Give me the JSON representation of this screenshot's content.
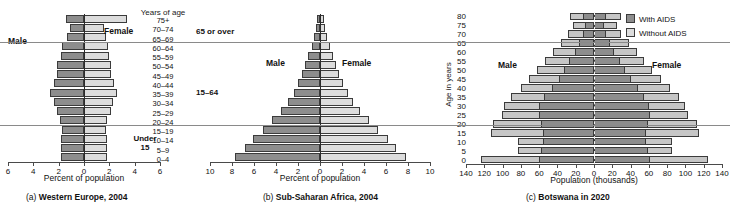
{
  "figure": {
    "panels": [
      "a",
      "b",
      "c"
    ]
  },
  "chart_data": [
    {
      "id": "a",
      "type": "bar",
      "orientation": "population-pyramid",
      "title": "(a) Western Europe, 2004",
      "caption_prefix": "(a)",
      "caption_text": "Western Europe, 2004",
      "xlabel": "Percent of population",
      "ylabel": "Years of age",
      "xlim": [
        -6,
        6
      ],
      "xticks": [
        "6",
        "4",
        "2",
        "0",
        "2",
        "4",
        "6"
      ],
      "xtick_values": [
        -6,
        -4,
        -2,
        0,
        2,
        4,
        6
      ],
      "grid": false,
      "legend_position": "none",
      "categories": [
        "75+",
        "70–74",
        "65–69",
        "60–64",
        "55–59",
        "50–54",
        "45–49",
        "40–44",
        "35–39",
        "30–34",
        "25–29",
        "20–24",
        "15–19",
        "10–14",
        "5–9",
        "0–4"
      ],
      "series": [
        {
          "name": "Male",
          "side": "left",
          "values": [
            2.2,
            1.7,
            2.0,
            2.6,
            2.8,
            3.2,
            3.2,
            3.6,
            4.1,
            3.6,
            3.3,
            2.9,
            2.7,
            2.8,
            2.8,
            2.8
          ]
        },
        {
          "name": "Female",
          "side": "right",
          "values": [
            5.1,
            2.4,
            2.6,
            2.9,
            3.0,
            3.2,
            3.2,
            3.6,
            4.0,
            3.5,
            3.2,
            2.8,
            2.6,
            2.7,
            2.7,
            2.7
          ]
        }
      ],
      "annotations": {
        "male_label": "Male",
        "female_label": "Female",
        "groups": [
          {
            "label": "65 or over",
            "categories": [
              "75+",
              "70–74",
              "65–69"
            ]
          },
          {
            "label": "15–64",
            "categories": [
              "60–64",
              "15–19"
            ]
          },
          {
            "label_line1": "Under",
            "label_line2": "15",
            "categories": [
              "10–14",
              "0–4"
            ]
          }
        ]
      }
    },
    {
      "id": "b",
      "type": "bar",
      "orientation": "population-pyramid",
      "title": "(b) Sub-Saharan Africa, 2004",
      "caption_prefix": "(b)",
      "caption_text": "Sub-Saharan Africa, 2004",
      "xlabel": "Percent of population",
      "ylabel": "Years of age",
      "xlim": [
        -10,
        10
      ],
      "xticks": [
        "10",
        "8",
        "6",
        "4",
        "2",
        "0",
        "2",
        "4",
        "6",
        "8",
        "10"
      ],
      "xtick_values": [
        -10,
        -8,
        -6,
        -4,
        -2,
        0,
        2,
        4,
        6,
        8,
        10
      ],
      "grid": false,
      "legend_position": "none",
      "categories": [
        "75+",
        "70–74",
        "65–69",
        "60–64",
        "55–59",
        "50–54",
        "45–49",
        "40–44",
        "35–39",
        "30–34",
        "25–29",
        "20–24",
        "15–19",
        "10–14",
        "5–9",
        "0–4"
      ],
      "series": [
        {
          "name": "Male",
          "side": "left",
          "values": [
            0.3,
            0.4,
            0.6,
            0.8,
            1.1,
            1.4,
            1.7,
            2.1,
            2.5,
            3.0,
            3.7,
            4.5,
            5.4,
            6.3,
            7.1,
            8.0
          ]
        },
        {
          "name": "Female",
          "side": "right",
          "values": [
            0.4,
            0.5,
            0.7,
            0.9,
            1.2,
            1.5,
            1.8,
            2.2,
            2.6,
            3.1,
            3.8,
            4.6,
            5.5,
            6.4,
            7.2,
            8.1
          ]
        }
      ],
      "annotations": {
        "male_label": "Male",
        "female_label": "Female"
      }
    },
    {
      "id": "c",
      "type": "bar",
      "orientation": "population-pyramid",
      "stacked": true,
      "title": "(c) Botswana in 2020",
      "caption_prefix": "(c)",
      "caption_text": "Botswana in 2020",
      "xlabel": "Population (thousands)",
      "ylabel": "Age in years",
      "xlim": [
        -140,
        140
      ],
      "xticks": [
        "140",
        "120",
        "100",
        "80",
        "60",
        "40",
        "20",
        "0",
        "20",
        "40",
        "60",
        "80",
        "100",
        "120",
        "140"
      ],
      "xtick_values": [
        -140,
        -120,
        -100,
        -80,
        -60,
        -40,
        -20,
        0,
        20,
        40,
        60,
        80,
        100,
        120,
        140
      ],
      "yticks": [
        "80",
        "75",
        "70",
        "65",
        "60",
        "55",
        "50",
        "45",
        "40",
        "35",
        "30",
        "25",
        "20",
        "15",
        "10",
        "5",
        "0"
      ],
      "grid": false,
      "legend_position": "top-right",
      "legend_entries": [
        {
          "label": "With AIDS",
          "color": "#8d8d8d"
        },
        {
          "label": "Without AIDS",
          "color": "#dcdcdc"
        }
      ],
      "categories": [
        "80",
        "75",
        "70",
        "65",
        "60",
        "55",
        "50",
        "45",
        "40",
        "35",
        "30",
        "25",
        "20",
        "15",
        "10",
        "5",
        "0"
      ],
      "series": [
        {
          "name": "Male With AIDS",
          "side": "left",
          "values": [
            12,
            10,
            13,
            17,
            22,
            28,
            34,
            40,
            48,
            56,
            62,
            62,
            60,
            58,
            58,
            60,
            62
          ]
        },
        {
          "name": "Male Without AIDS",
          "side": "left",
          "values": [
            15,
            14,
            16,
            20,
            24,
            27,
            30,
            33,
            35,
            38,
            40,
            42,
            54,
            58,
            28,
            26,
            66
          ]
        },
        {
          "name": "Female With AIDS",
          "side": "right",
          "values": [
            14,
            11,
            14,
            18,
            23,
            29,
            35,
            42,
            50,
            57,
            62,
            63,
            61,
            59,
            59,
            61,
            63
          ]
        },
        {
          "name": "Female Without AIDS",
          "side": "right",
          "values": [
            16,
            15,
            17,
            21,
            25,
            28,
            31,
            34,
            36,
            39,
            41,
            43,
            55,
            59,
            29,
            27,
            66
          ]
        }
      ],
      "annotations": {
        "male_label": "Male",
        "female_label": "Female"
      }
    }
  ]
}
